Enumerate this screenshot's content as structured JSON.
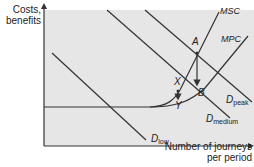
{
  "diagram": {
    "type": "economics-road-congestion",
    "y_axis_label_line1": "Costs,",
    "y_axis_label_line2": "benefits",
    "x_axis_label_line1": "Number of journeys",
    "x_axis_label_line2": "per period",
    "curves": {
      "msc": "MSC",
      "mpc": "MPC",
      "d_low_main": "D",
      "d_low_sub": "low",
      "d_medium_main": "D",
      "d_medium_sub": "medium",
      "d_peak_main": "D",
      "d_peak_sub": "peak"
    },
    "points": {
      "a": "A",
      "b": "B",
      "x": "X",
      "y": "Y"
    },
    "colors": {
      "panel": "#e6e6e6",
      "line": "#333333",
      "axis": "#333333"
    }
  }
}
